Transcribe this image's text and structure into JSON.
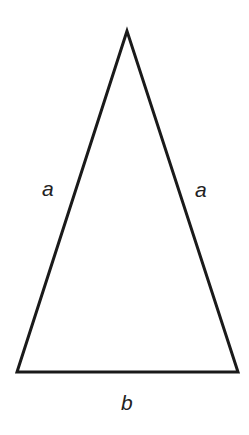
{
  "diagram": {
    "type": "isosceles-triangle",
    "stroke_color": "#1a1a1a",
    "background": "#ffffff",
    "vertices": {
      "apex": [
        127,
        31
      ],
      "bottom_left": [
        17,
        372
      ],
      "bottom_right": [
        238,
        372
      ]
    },
    "labels": {
      "left_side": "a",
      "right_side": "a",
      "base": "b"
    }
  }
}
